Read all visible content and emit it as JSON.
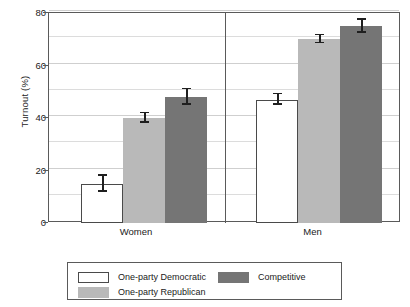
{
  "chart_data": {
    "type": "bar",
    "title": "",
    "xlabel": "",
    "ylabel": "Turnout (%)",
    "ylim": [
      0,
      80
    ],
    "yticks": [
      0,
      20,
      40,
      60,
      80
    ],
    "ytick_labels": [
      "0",
      "20",
      "40",
      "60",
      "80"
    ],
    "grid": true,
    "grid_minor_step": 10,
    "legend_position": "bottom",
    "panels": [
      "Women",
      "Men"
    ],
    "categories": [
      "Women",
      "Men"
    ],
    "series": [
      {
        "name": "One-party Democratic",
        "color": "#ffffff",
        "values": [
          15,
          47
        ],
        "errors": [
          3.0,
          2.0
        ]
      },
      {
        "name": "One-party Republican",
        "color": "#b9b9b9",
        "values": [
          40,
          70
        ],
        "errors": [
          1.8,
          1.5
        ]
      },
      {
        "name": "Competitive",
        "color": "#757575",
        "values": [
          48,
          75
        ],
        "errors": [
          3.0,
          2.5
        ]
      }
    ]
  },
  "axis": {
    "y_title": "Turnout (%)",
    "y_ticks": [
      "80",
      "60",
      "40",
      "20",
      "0"
    ],
    "x_ticks": [
      "Women",
      "Men"
    ]
  },
  "legend": {
    "entries": [
      {
        "label": "One-party Democratic",
        "swatch": "c0"
      },
      {
        "label": "One-party Republican",
        "swatch": "c1"
      },
      {
        "label": "Competitive",
        "swatch": "c2"
      }
    ]
  },
  "colors": {
    "democratic": "#ffffff",
    "republican": "#b9b9b9",
    "competitive": "#757575",
    "frame": "#5a5a5a",
    "grid": "#dcdcdc"
  }
}
